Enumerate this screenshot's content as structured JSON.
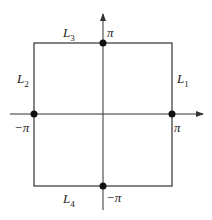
{
  "diagram": {
    "type": "square contour in the plane with axes",
    "edges": [
      {
        "id": "L1",
        "base": "L",
        "sub": "1",
        "side": "right"
      },
      {
        "id": "L2",
        "base": "L",
        "sub": "2",
        "side": "left"
      },
      {
        "id": "L3",
        "base": "L",
        "sub": "3",
        "side": "top"
      },
      {
        "id": "L4",
        "base": "L",
        "sub": "4",
        "side": "bottom"
      }
    ],
    "points": [
      {
        "label": "π",
        "position": "top",
        "coord": [
          0,
          3.14159
        ]
      },
      {
        "label": "−π",
        "position": "left",
        "coord": [
          -3.14159,
          0
        ]
      },
      {
        "label": "π",
        "position": "right",
        "coord": [
          3.14159,
          0
        ]
      },
      {
        "label": "−π",
        "position": "bottom",
        "coord": [
          0,
          -3.14159
        ]
      }
    ],
    "colors": {
      "line": "#333333",
      "dot": "#111111"
    }
  }
}
